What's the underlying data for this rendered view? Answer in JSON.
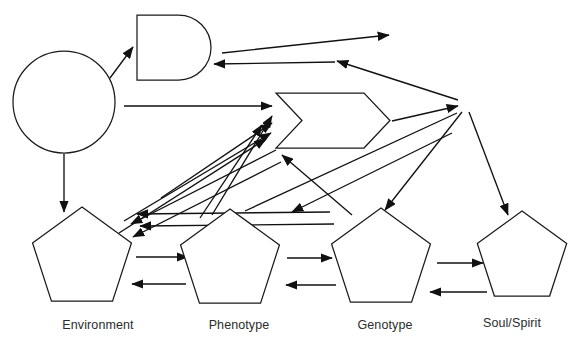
{
  "diagram": {
    "background_color": "#ffffff",
    "stroke_color": "#111111",
    "label_color": "#2b2b2b",
    "nodes": [
      {
        "id": "circle-node",
        "name": "circle-node",
        "shape": "circle",
        "label": "",
        "cx": 64,
        "cy": 102,
        "r": 51
      },
      {
        "id": "dshape-node",
        "name": "d-shape-node",
        "shape": "d-shape",
        "label": "",
        "x": 137,
        "y": 15,
        "width": 74,
        "height": 65
      },
      {
        "id": "chevron-node",
        "name": "chevron-node",
        "shape": "chevron",
        "label": "",
        "x": 276,
        "y": 93,
        "width": 114,
        "height": 55
      },
      {
        "id": "environment",
        "name": "pentagon-environment",
        "shape": "pentagon",
        "label": "Environment",
        "cx": 82,
        "cy": 259,
        "r": 52,
        "label_x": 98,
        "label_y": 326
      },
      {
        "id": "phenotype",
        "name": "pentagon-phenotype",
        "shape": "pentagon",
        "label": "Phenotype",
        "cx": 230,
        "cy": 261,
        "r": 52,
        "label_x": 239,
        "label_y": 326
      },
      {
        "id": "genotype",
        "name": "pentagon-genotype",
        "shape": "pentagon",
        "label": "Genotype",
        "cx": 381,
        "cy": 260,
        "r": 52,
        "label_x": 385,
        "label_y": 326
      },
      {
        "id": "soul-spirit",
        "name": "pentagon-soul-spirit",
        "shape": "pentagon",
        "label": "Soul/Spirit",
        "cx": 522,
        "cy": 258,
        "r": 47,
        "label_x": 512,
        "label_y": 324
      },
      {
        "id": "hub-node",
        "name": "hub-junction",
        "shape": "junction",
        "label": "",
        "cx": 462,
        "cy": 105,
        "r": 0
      }
    ],
    "edges": [
      {
        "name": "edge-circle-to-dshape",
        "from": "circle-node",
        "to": "dshape-node",
        "x1": 110,
        "y1": 78,
        "x2": 133,
        "y2": 47,
        "arrow_end": true,
        "arrow_start": false
      },
      {
        "name": "edge-dshape-to-right",
        "from": "dshape-node",
        "to": "hub-node",
        "x1": 222,
        "y1": 53,
        "x2": 389,
        "y2": 35,
        "arrow_end": true,
        "arrow_start": false
      },
      {
        "name": "edge-hub-to-dshape",
        "from": "hub-node",
        "to": "dshape-node",
        "x1": 458,
        "y1": 100,
        "x2": 337,
        "y2": 61,
        "arrow_end": true,
        "arrow_start": false
      },
      {
        "name": "edge-mid-to-dshape",
        "from": "chevron-node",
        "to": "dshape-node",
        "x1": 335,
        "y1": 62,
        "x2": 214,
        "y2": 64,
        "arrow_end": true,
        "arrow_start": false
      },
      {
        "name": "edge-circle-to-chevron",
        "from": "circle-node",
        "to": "chevron-node",
        "x1": 124,
        "y1": 106,
        "x2": 272,
        "y2": 106,
        "arrow_end": true,
        "arrow_start": false
      },
      {
        "name": "edge-chevron-to-hub",
        "from": "chevron-node",
        "to": "hub-node",
        "x1": 392,
        "y1": 121,
        "x2": 458,
        "y2": 106,
        "arrow_end": true,
        "arrow_start": false
      },
      {
        "name": "edge-circle-to-environment",
        "from": "circle-node",
        "to": "environment",
        "x1": 64,
        "y1": 154,
        "x2": 64,
        "y2": 212,
        "arrow_end": true,
        "arrow_start": false
      },
      {
        "name": "edge-environment-to-chevron-a",
        "from": "environment",
        "to": "chevron-node",
        "x1": 161,
        "y1": 198,
        "x2": 272,
        "y2": 123,
        "arrow_end": true,
        "arrow_start": false
      },
      {
        "name": "edge-environment-to-chevron-b",
        "from": "environment",
        "to": "chevron-node",
        "x1": 124,
        "y1": 221,
        "x2": 271,
        "y2": 133,
        "arrow_end": true,
        "arrow_start": false
      },
      {
        "name": "edge-environment-to-chevron-c",
        "from": "environment",
        "to": "chevron-node",
        "x1": 119,
        "y1": 233,
        "x2": 266,
        "y2": 139,
        "arrow_end": true,
        "arrow_start": false
      },
      {
        "name": "edge-hub-to-environment-a",
        "from": "hub-node",
        "to": "environment",
        "x1": 276,
        "y1": 150,
        "x2": 131,
        "y2": 224,
        "arrow_end": true,
        "arrow_start": false
      },
      {
        "name": "edge-hub-to-environment-b",
        "from": "hub-node",
        "to": "environment",
        "x1": 281,
        "y1": 162,
        "x2": 133,
        "y2": 237,
        "arrow_end": true,
        "arrow_start": false
      },
      {
        "name": "edge-genotype-to-environment-a",
        "from": "genotype",
        "to": "environment",
        "x1": 330,
        "y1": 212,
        "x2": 137,
        "y2": 214,
        "arrow_end": true,
        "arrow_start": false
      },
      {
        "name": "edge-genotype-to-environment-b",
        "from": "genotype",
        "to": "environment",
        "x1": 334,
        "y1": 224,
        "x2": 140,
        "y2": 226,
        "arrow_end": true,
        "arrow_start": false
      },
      {
        "name": "edge-phenotype-to-chevron",
        "from": "phenotype",
        "to": "chevron-node",
        "x1": 200,
        "y1": 218,
        "x2": 262,
        "y2": 125,
        "arrow_end": true,
        "arrow_start": false
      },
      {
        "name": "edge-phenotype-up",
        "from": "phenotype",
        "to": "chevron-node",
        "x1": 212,
        "y1": 215,
        "x2": 272,
        "y2": 116,
        "arrow_end": true,
        "arrow_start": false
      },
      {
        "name": "edge-genotype-to-chevron",
        "from": "genotype",
        "to": "chevron-node",
        "x1": 352,
        "y1": 215,
        "x2": 282,
        "y2": 155,
        "arrow_end": true,
        "arrow_start": false
      },
      {
        "name": "edge-hub-to-phenotype",
        "from": "hub-node",
        "to": "phenotype",
        "x1": 452,
        "y1": 133,
        "x2": 292,
        "y2": 212,
        "arrow_end": true,
        "arrow_start": false
      },
      {
        "name": "edge-hub-to-genotype",
        "from": "hub-node",
        "to": "genotype",
        "x1": 462,
        "y1": 112,
        "x2": 385,
        "y2": 210,
        "arrow_end": true,
        "arrow_start": false
      },
      {
        "name": "edge-hub-to-soul",
        "from": "hub-node",
        "to": "soul-spirit",
        "x1": 469,
        "y1": 112,
        "x2": 508,
        "y2": 215,
        "arrow_end": true,
        "arrow_start": false
      },
      {
        "name": "edge-phenotype-to-hub",
        "from": "phenotype",
        "to": "hub-node",
        "x1": 245,
        "y1": 211,
        "x2": 457,
        "y2": 113,
        "arrow_end": false,
        "arrow_start": false
      },
      {
        "name": "edge-environment-to-phenotype",
        "from": "environment",
        "to": "phenotype",
        "x1": 136,
        "y1": 257,
        "x2": 188,
        "y2": 257,
        "arrow_end": true,
        "arrow_start": false
      },
      {
        "name": "edge-phenotype-to-environment",
        "from": "phenotype",
        "to": "environment",
        "x1": 186,
        "y1": 284,
        "x2": 132,
        "y2": 284,
        "arrow_end": true,
        "arrow_start": false
      },
      {
        "name": "edge-phenotype-to-genotype",
        "from": "phenotype",
        "to": "genotype",
        "x1": 287,
        "y1": 258,
        "x2": 332,
        "y2": 258,
        "arrow_end": true,
        "arrow_start": false
      },
      {
        "name": "edge-genotype-to-phenotype",
        "from": "genotype",
        "to": "phenotype",
        "x1": 336,
        "y1": 285,
        "x2": 286,
        "y2": 285,
        "arrow_end": true,
        "arrow_start": false
      },
      {
        "name": "edge-genotype-to-soul",
        "from": "genotype",
        "to": "soul-spirit",
        "x1": 437,
        "y1": 263,
        "x2": 483,
        "y2": 263,
        "arrow_end": true,
        "arrow_start": false
      },
      {
        "name": "edge-soul-to-genotype",
        "from": "soul-spirit",
        "to": "genotype",
        "x1": 487,
        "y1": 292,
        "x2": 430,
        "y2": 292,
        "arrow_end": true,
        "arrow_start": false
      }
    ]
  }
}
